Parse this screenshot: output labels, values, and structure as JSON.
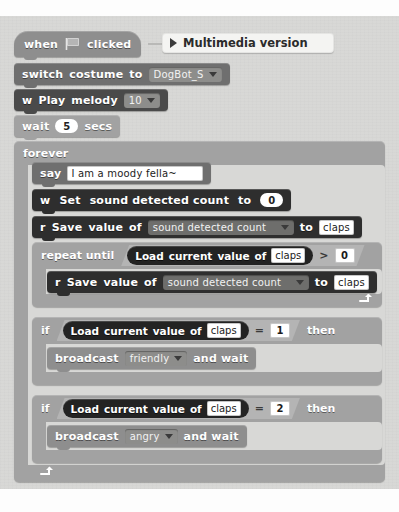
{
  "script": {
    "title": "Scratch block script",
    "comment": {
      "label": "Multimedia version",
      "expander_icon": "triangle-right-icon"
    },
    "blocks": [
      {
        "id": "when-flag-clicked",
        "type": "hat",
        "words": [
          "when",
          "clicked"
        ],
        "icon": "green-flag-icon"
      },
      {
        "id": "switch-costume",
        "type": "stack",
        "words": [
          "switch",
          "costume",
          "to"
        ],
        "dropdown": "DogBot_S",
        "dropdown_icon": "chevron-down-icon"
      },
      {
        "id": "play-melody",
        "type": "stack",
        "words": [
          "w",
          "Play",
          "melody"
        ],
        "dropdown": "10",
        "dropdown_icon": "chevron-down-icon"
      },
      {
        "id": "wait-secs",
        "type": "stack",
        "words": [
          "wait",
          "secs"
        ],
        "value": "5"
      },
      {
        "id": "forever",
        "type": "c-block",
        "label": "forever",
        "loop_icon": "loop-arrow-icon"
      },
      {
        "id": "say",
        "type": "stack",
        "label": "say",
        "text_value": "I am a moody fella~"
      },
      {
        "id": "set-sound-detected-count",
        "type": "stack",
        "words": [
          "w",
          "Set",
          "sound",
          "detected",
          "count",
          "to"
        ],
        "value": "0"
      },
      {
        "id": "save-value-of-1",
        "type": "stack",
        "words": [
          "r",
          "Save",
          "value",
          "of"
        ],
        "dropdown": "sound detected count",
        "dropdown_icon": "chevron-down-icon",
        "to_label": "to",
        "target": "claps"
      },
      {
        "id": "repeat-until",
        "type": "c-block",
        "label": "repeat until",
        "loop_icon": "loop-arrow-icon",
        "condition": {
          "reporter_words": [
            "Load",
            "current",
            "value",
            "of"
          ],
          "reporter_field": "claps",
          "operator": ">",
          "operand": "0"
        }
      },
      {
        "id": "save-value-of-2",
        "type": "stack",
        "words": [
          "r",
          "Save",
          "value",
          "of"
        ],
        "dropdown": "sound detected count",
        "dropdown_icon": "chevron-down-icon",
        "to_label": "to",
        "target": "claps"
      },
      {
        "id": "if-claps-equals-1",
        "type": "c-block",
        "label": "if",
        "then_label": "then",
        "condition": {
          "reporter_words": [
            "Load",
            "current",
            "value",
            "of"
          ],
          "reporter_field": "claps",
          "operator": "=",
          "operand": "1"
        }
      },
      {
        "id": "broadcast-friendly",
        "type": "stack",
        "label": "broadcast",
        "dropdown": "friendly",
        "dropdown_icon": "chevron-down-icon",
        "suffix": "and wait"
      },
      {
        "id": "if-claps-equals-2",
        "type": "c-block",
        "label": "if",
        "then_label": "then",
        "condition": {
          "reporter_words": [
            "Load",
            "current",
            "value",
            "of"
          ],
          "reporter_field": "claps",
          "operator": "=",
          "operand": "2"
        }
      },
      {
        "id": "broadcast-angry",
        "type": "stack",
        "label": "broadcast",
        "dropdown": "angry",
        "dropdown_icon": "chevron-down-icon",
        "suffix": "and wait"
      }
    ]
  },
  "text": {
    "when": "when",
    "clicked": "clicked",
    "switch": "switch",
    "costume": "costume",
    "to": "to",
    "costume_value": "DogBot_S",
    "w": "w",
    "play": "Play",
    "melody": "melody",
    "melody_value": "10",
    "wait": "wait",
    "wait_value": "5",
    "secs": "secs",
    "forever": "forever",
    "say": "say",
    "say_value": "I am a moody fella~",
    "set": "Set",
    "sound_detected_count_words": "sound   detected   count",
    "set_value": "0",
    "r": "r",
    "save": "Save",
    "value": "value",
    "of": "of",
    "sound_detected_count": "sound detected count",
    "claps": "claps",
    "repeat_until": "repeat until",
    "load": "Load",
    "current": "current",
    "gt": ">",
    "eq": "=",
    "zero": "0",
    "one": "1",
    "two": "2",
    "if": "if",
    "then": "then",
    "broadcast": "broadcast",
    "friendly": "friendly",
    "angry": "angry",
    "and_wait": "and wait",
    "comment_label": "Multimedia version"
  },
  "colors": {
    "event": "#8e8e8e",
    "looks": "#6f6f6f",
    "extension": "#4a4a4a",
    "extension_dark": "#2e2e2e",
    "control": "#a2a2a2",
    "reporter": "#232323",
    "canvas": "#d8d8d6",
    "field": "#ffffff"
  }
}
